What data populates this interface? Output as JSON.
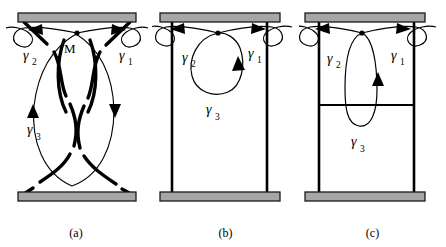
{
  "figure": {
    "background_color": "#ffffff",
    "stroke_color": "#000000",
    "bar_fill_color": "#a6a6a6",
    "bar_stroke_color": "#1a1a1a",
    "width": 446,
    "height": 247
  },
  "panels": [
    {
      "id": "a",
      "caption": "(a)",
      "labels": {
        "gamma1": "γ",
        "gamma1_sub": "1",
        "gamma2": "γ",
        "gamma2_sub": "2",
        "gamma3": "γ",
        "gamma3_sub": "3",
        "basepoint": "M"
      }
    },
    {
      "id": "b",
      "caption": "(b)",
      "labels": {
        "gamma1": "γ",
        "gamma1_sub": "1",
        "gamma2": "γ",
        "gamma2_sub": "2",
        "gamma3": "γ",
        "gamma3_sub": "3"
      }
    },
    {
      "id": "c",
      "caption": "(c)",
      "labels": {
        "gamma1": "γ",
        "gamma1_sub": "1",
        "gamma2": "γ",
        "gamma2_sub": "2",
        "gamma3": "γ",
        "gamma3_sub": "3"
      }
    }
  ]
}
